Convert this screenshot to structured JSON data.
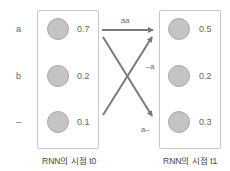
{
  "row_labels": [
    "a",
    "b",
    "–"
  ],
  "left": {
    "caption": "RNN의 시점 t0",
    "values": [
      "0.7",
      "0.2",
      "0.1"
    ]
  },
  "right": {
    "caption": "RNN의 시점 t1",
    "values": [
      "0.5",
      "0.2",
      "0.3"
    ]
  },
  "edges": {
    "top": "aa",
    "middle": "–a",
    "bottom": "a–"
  },
  "colors": {
    "node_fill": "#c4c4c4",
    "arrow": "#7a7a7a",
    "box_border": "#c8c8c8"
  }
}
